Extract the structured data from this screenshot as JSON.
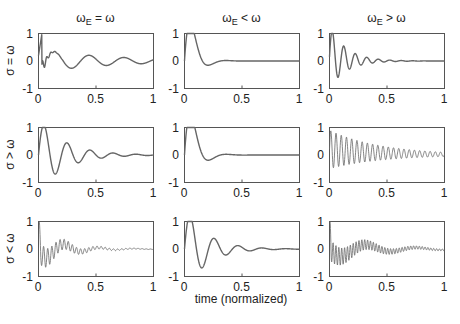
{
  "chart_data": {
    "type": "line",
    "layout": "3x3 grid of subplots",
    "xlabel": "time (normalized)",
    "xlim": [
      0,
      1
    ],
    "ylim": [
      -1,
      1
    ],
    "xticks": [
      "0",
      "0.5",
      "1"
    ],
    "yticks": [
      "1",
      "0",
      "-1"
    ],
    "grid": false,
    "legend": null,
    "column_titles": [
      "ωE = ω",
      "ωE < ω",
      "ωE > ω"
    ],
    "row_labels": [
      "σ = ω",
      "σ > ω",
      "σ < ω"
    ],
    "subplots": [
      {
        "row": 0,
        "col": 0,
        "title": "ωE = ω",
        "ylabel": "σ = ω",
        "description": "damped oscillation, initial fast ripple near 0 then slow oscillation",
        "model": {
          "amp": 1.0,
          "freq": 3.3,
          "decay": 1.8,
          "phase": 1.57,
          "offset": 0.0,
          "ripple_amp": 0.35,
          "ripple_freq": 40,
          "ripple_decay": 25
        },
        "key_points": [
          [
            0.02,
            1.0
          ],
          [
            0.15,
            -0.5
          ],
          [
            0.3,
            0.38
          ],
          [
            0.45,
            -0.25
          ],
          [
            0.6,
            0.22
          ],
          [
            0.77,
            -0.12
          ],
          [
            0.92,
            0.12
          ],
          [
            1.0,
            0.0
          ]
        ]
      },
      {
        "row": 0,
        "col": 1,
        "title": "ωE < ω",
        "description": "single overshoot then settles to 0",
        "model": {
          "amp": 1.0,
          "freq": 3.2,
          "decay": 14,
          "phase": 0,
          "offset": 0.0
        },
        "key_points": [
          [
            0.0,
            0.0
          ],
          [
            0.07,
            1.0
          ],
          [
            0.2,
            -0.05
          ],
          [
            0.35,
            0.0
          ],
          [
            1.0,
            0.0
          ]
        ]
      },
      {
        "row": 0,
        "col": 2,
        "title": "ωE > ω",
        "description": "fast damped oscillation settling to 0",
        "model": {
          "amp": 1.0,
          "freq": 10,
          "decay": 7,
          "phase": 0,
          "offset": 0.0
        },
        "key_points": [
          [
            0.04,
            1.0
          ],
          [
            0.1,
            -0.1
          ],
          [
            0.15,
            0.55
          ],
          [
            0.25,
            0.3
          ],
          [
            0.5,
            0.05
          ],
          [
            1.0,
            0.0
          ]
        ]
      },
      {
        "row": 1,
        "col": 0,
        "ylabel": "σ > ω",
        "description": "damped oscillation",
        "model": {
          "amp": 1.0,
          "freq": 5,
          "decay": 4.5,
          "phase": 0,
          "offset": 0.0
        },
        "key_points": [
          [
            0.06,
            1.0
          ],
          [
            0.17,
            -0.5
          ],
          [
            0.27,
            0.35
          ],
          [
            0.37,
            -0.2
          ],
          [
            0.47,
            0.15
          ],
          [
            0.57,
            -0.05
          ],
          [
            1.0,
            0.0
          ]
        ]
      },
      {
        "row": 1,
        "col": 1,
        "description": "single overshoot then settles to 0",
        "model": {
          "amp": 1.0,
          "freq": 3.2,
          "decay": 13,
          "phase": 0,
          "offset": 0.0
        },
        "key_points": [
          [
            0.0,
            0.0
          ],
          [
            0.05,
            1.0
          ],
          [
            0.25,
            0.0
          ],
          [
            1.0,
            0.0
          ]
        ]
      },
      {
        "row": 1,
        "col": 2,
        "description": "fast oscillation with slow decay",
        "model": {
          "amp": 1.0,
          "freq": 22,
          "decay": 2.2,
          "phase": 0,
          "offset": 0.0
        },
        "key_points": [
          [
            0.02,
            1.0
          ],
          [
            0.5,
            0.15
          ],
          [
            1.0,
            0.05
          ]
        ]
      },
      {
        "row": 2,
        "col": 0,
        "ylabel": "σ < ω",
        "description": "high-frequency beating oscillation decaying to 0",
        "model": {
          "amp": 0.6,
          "freq": 28,
          "decay": 4,
          "phase": 0,
          "offset": 0.0,
          "envelope_freq": 3.3
        },
        "key_points": [
          [
            0.0,
            1.0
          ],
          [
            0.1,
            -0.6
          ],
          [
            0.25,
            0.3
          ],
          [
            0.5,
            0.1
          ],
          [
            0.7,
            0.0
          ],
          [
            1.0,
            0.0
          ]
        ]
      },
      {
        "row": 2,
        "col": 1,
        "description": "large oscillation reaching -1, then settles",
        "model": {
          "amp": 1.0,
          "freq": 4.8,
          "decay": 5.5,
          "phase": 0,
          "offset": 0.0
        },
        "key_points": [
          [
            0.05,
            0.9
          ],
          [
            0.17,
            -1.0
          ],
          [
            0.27,
            0.55
          ],
          [
            0.37,
            -0.15
          ],
          [
            0.45,
            0.0
          ],
          [
            1.0,
            0.0
          ]
        ]
      },
      {
        "row": 2,
        "col": 2,
        "description": "high-frequency oscillation with slow envelope, decaying",
        "model": {
          "amp": 0.6,
          "freq": 40,
          "decay": 2.5,
          "phase": 0,
          "offset": 0.0,
          "envelope_freq": 2.3
        },
        "key_points": [
          [
            0.0,
            1.0
          ],
          [
            0.2,
            -0.6
          ],
          [
            0.42,
            0.3
          ],
          [
            0.7,
            0.0
          ],
          [
            1.0,
            0.0
          ]
        ]
      }
    ]
  }
}
